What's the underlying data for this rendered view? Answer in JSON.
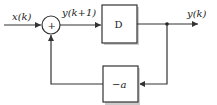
{
  "diagram": {
    "type": "block-diagram",
    "input_label": "x(k)",
    "sum_label": "y(k+1)",
    "output_label": "y(k)",
    "summer_symbol": "+",
    "delay_block_label": "D",
    "feedback_block_label": "−a",
    "colors": {
      "line": "#333333",
      "block_fill": "#ffffff",
      "shadow": "#cccccc"
    }
  }
}
